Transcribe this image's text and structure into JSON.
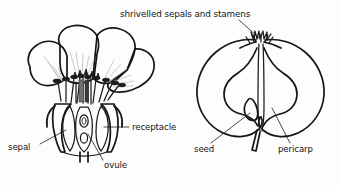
{
  "figure": {
    "kind": "botanical-line-diagram",
    "background_color": "#fdfdfd",
    "ink_color": "#151515",
    "vein_color": "#b4b4b4"
  },
  "title": {
    "text": "shrivelled sepals and stamens"
  },
  "labels": {
    "sepal": "sepal",
    "ovule": "ovule",
    "receptacle": "receptacle",
    "seed": "seed",
    "pericarp": "pericarp"
  },
  "panels": {
    "left": {
      "name": "flower-longitudinal-section",
      "parts": [
        "petals",
        "stamens",
        "receptacle",
        "ovary",
        "ovules",
        "sepal"
      ]
    },
    "right": {
      "name": "apple-fruit-longitudinal-section",
      "parts": [
        "shrivelled sepals and stamens",
        "seed",
        "pericarp",
        "core",
        "stalk"
      ]
    }
  }
}
